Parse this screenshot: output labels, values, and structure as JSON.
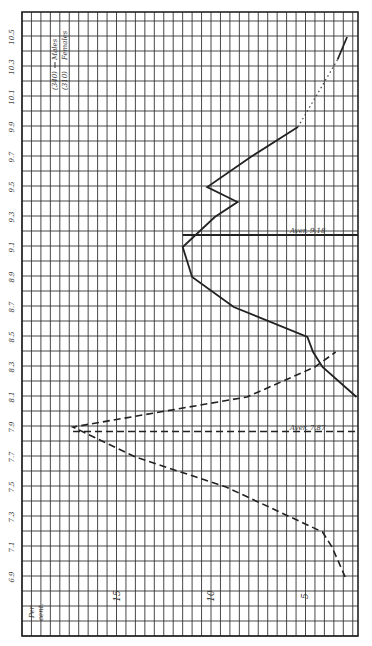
{
  "chart_data": {
    "type": "line",
    "orientation": "rotated-90-ccw",
    "title": "",
    "xlabel": "Age",
    "ylabel": "Per cent.",
    "ylim": [
      2,
      19
    ],
    "xlim": [
      6.8,
      10.6
    ],
    "grid": true,
    "x_ticks": [
      "6.9",
      "7.1",
      "7.3",
      "7.5",
      "7.7",
      "7.9",
      "8.1",
      "8.3",
      "8.5",
      "8.7",
      "8.9",
      "9.1",
      "9.3",
      "9.5",
      "9.7",
      "9.9",
      "10.1",
      "10.3",
      "10.5"
    ],
    "y_ticks": [
      "5",
      "10",
      "15"
    ],
    "legend": [
      {
        "label": "(340) Males",
        "style": "solid"
      },
      {
        "label": "(310) Females",
        "style": "dashed"
      }
    ],
    "series": [
      {
        "name": "Males (340)",
        "style": "solid",
        "x": [
          8.1,
          8.3,
          8.4,
          8.5,
          8.7,
          8.9,
          9.1,
          9.3,
          9.4,
          9.5,
          9.7,
          9.9,
          10.0,
          10.5
        ],
        "values": [
          2.3,
          4.1,
          4.6,
          4.9,
          8.8,
          11.0,
          11.5,
          9.8,
          8.6,
          10.2,
          7.9,
          5.4,
          4.2,
          2.8
        ],
        "segment_dotted_between": [
          9.9,
          10.4
        ]
      },
      {
        "name": "Females (310)",
        "style": "dashed",
        "x": [
          6.9,
          7.1,
          7.2,
          7.5,
          7.7,
          7.9,
          8.1,
          8.3,
          8.4
        ],
        "values": [
          2.9,
          3.6,
          4.1,
          9.2,
          14.0,
          17.3,
          8.1,
          4.5,
          3.4
        ]
      }
    ],
    "annotations": [
      {
        "text": "Aver. 9.18",
        "series": "Males",
        "x": 9.18,
        "style": "solid vertical line"
      },
      {
        "text": "Aver. 7.87",
        "series": "Females",
        "x": 7.87,
        "style": "dashed vertical line"
      }
    ]
  },
  "labels": {
    "axis_label_line1": "Per",
    "axis_label_line2": "cent.",
    "legend_males_count": "(340)",
    "legend_males": "Males",
    "legend_females_count": "(310)",
    "legend_females": "Females",
    "aver_males": "Aver. 9.18",
    "aver_females": "Aver. 7.87",
    "ytick_5": "5",
    "ytick_10": "10",
    "ytick_15": "15"
  }
}
